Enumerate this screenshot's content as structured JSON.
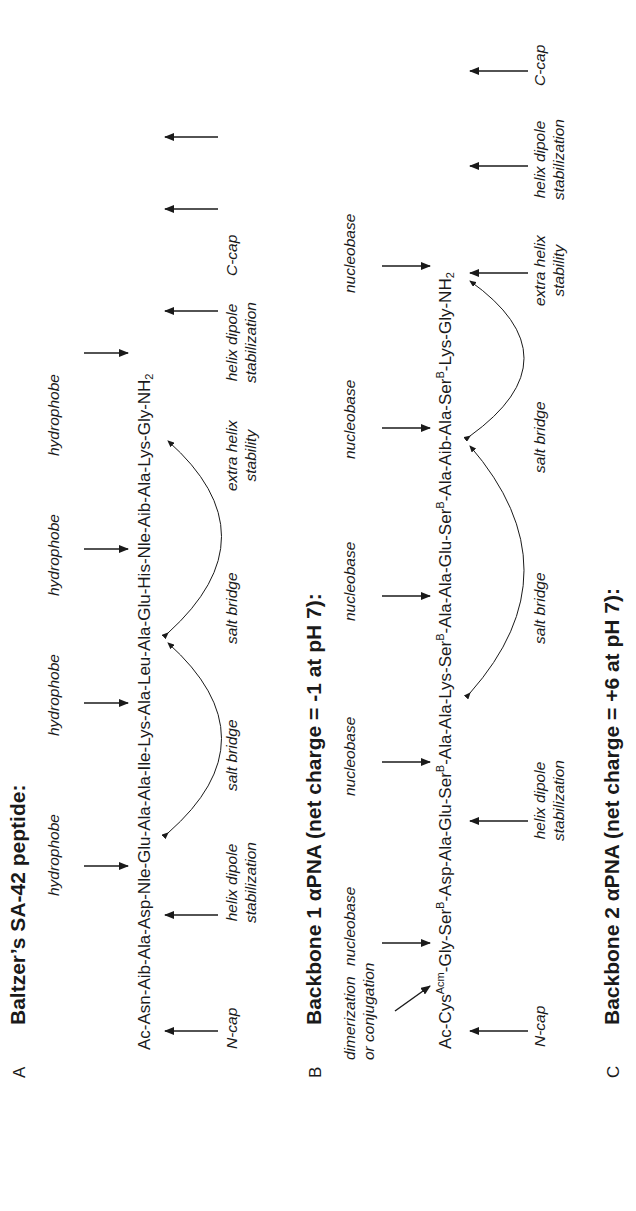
{
  "panels": {
    "A": {
      "letter": "A",
      "title": "Baltzer’s SA-42 peptide:",
      "sequence": "Ac-Asn-Aib-Ala-Asp-Nle-Glu-Ala-Ala-Ile-Lys-Ala-Leu-Ala-Glu-His-Nle-Aib-Ala-Lys-Gly-NH",
      "sequence_sub": "2",
      "top_labels": [
        "hydrophobe",
        "hydrophobe",
        "hydrophobe",
        "hydrophobe"
      ],
      "bottom_labels": {
        "ncap": "N-cap",
        "helix_dipole_1": "helix dipole",
        "helix_dipole_1b": "stabilization",
        "salt_bridge_1": "salt bridge",
        "salt_bridge_2": "salt bridge",
        "extra_helix": "extra helix",
        "extra_helix_b": "stability",
        "helix_dipole_2": "helix dipole",
        "helix_dipole_2b": "stabilization",
        "ccap": "C-cap"
      }
    },
    "B": {
      "letter": "B",
      "title": "Backbone 1 αPNA (net charge = -1 at pH 7):",
      "seq_parts": [
        "Ac-Cys",
        "Acm",
        "-Gly-Ser",
        "B",
        "-Asp-Ala-Glu-Ser",
        "B",
        "-Ala-Ala-Lys-Ser",
        "B",
        "-Ala-Ala-Glu-Ser",
        "B",
        "-Ala-Aib-Ala-Ser",
        "B",
        "-Lys-Gly-NH",
        "2"
      ],
      "top_labels": {
        "dimerization": "dimerization",
        "conjugation": "or conjugation",
        "nucleobase_1": "nucleobase",
        "nucleobase_2": "nucleobase",
        "nucleobase_3": "nucleobase",
        "nucleobase_4": "nucleobase",
        "nucleobase_5": "nucleobase"
      },
      "bottom_labels": {
        "ncap": "N-cap",
        "helix_dipole_1": "helix dipole",
        "helix_dipole_1b": "stabilization",
        "salt_bridge_1": "salt bridge",
        "salt_bridge_2": "salt bridge",
        "extra_helix": "extra helix",
        "extra_helix_b": "stability",
        "helix_dipole_2": "helix dipole",
        "helix_dipole_2b": "stabilization",
        "ccap": "C-cap"
      }
    },
    "C": {
      "letter": "C",
      "title": "Backbone 2 αPNA (net charge = +6 at pH 7):"
    }
  }
}
